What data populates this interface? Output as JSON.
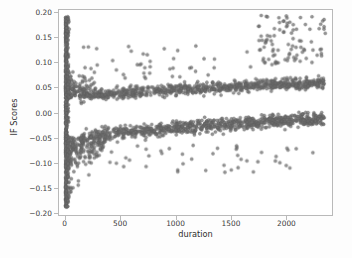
{
  "chart_data": {
    "type": "scatter",
    "title": "",
    "xlabel": "duration",
    "ylabel": "IF Scores",
    "xlim": [
      -60,
      2420
    ],
    "ylim": [
      -0.205,
      0.205
    ],
    "xticks": [
      0,
      500,
      1000,
      1500,
      2000
    ],
    "xticklabels": [
      "0",
      "500",
      "1000",
      "1500",
      "2000"
    ],
    "yticks": [
      0.2,
      0.15,
      0.1,
      0.05,
      0.0,
      -0.05,
      -0.1,
      -0.15,
      -0.2
    ],
    "yticklabels": [
      "0.20",
      "0.15",
      "0.10",
      "0.05",
      "0.00",
      "−0.05",
      "−0.10",
      "−0.15",
      "−0.20"
    ],
    "grid": false,
    "legend": null,
    "marker": {
      "shape": "circle",
      "color": "#6e6e6e",
      "edge_color": "#5a5a5a",
      "size_px": 3.1,
      "alpha": 0.72
    },
    "axes_frame_color": "#b9b9b9",
    "background_color": "#ffffff",
    "figure_background_color": "#fdfdfd",
    "n_points_approx": 2600,
    "clusters": [
      {
        "name": "origin-column",
        "description": "dense near-vertical column of points at duration close to 0 spanning the full IF score range",
        "x_range": [
          0,
          35
        ],
        "y_range": [
          -0.19,
          0.192
        ],
        "n": 540
      },
      {
        "name": "origin-funnel",
        "description": "funnel shaped spread fanning out from the origin column toward duration 350, narrowing toward the two bands",
        "x_range": [
          20,
          360
        ],
        "y_range": [
          -0.165,
          0.125
        ],
        "n": 360
      },
      {
        "name": "upper-band",
        "description": "dense horizontal band drifting upward from about 0.030 to 0.060 as duration increases",
        "x_range": [
          120,
          2350
        ],
        "y_start": 0.03,
        "y_end": 0.06,
        "y_spread": 0.009,
        "n": 760
      },
      {
        "name": "lower-band",
        "description": "dense horizontal band drifting upward from about -0.052 to -0.012 as duration increases",
        "x_range": [
          110,
          2350
        ],
        "y_start": -0.052,
        "y_end": -0.012,
        "y_spread": 0.011,
        "n": 820
      },
      {
        "name": "upper-right-cloud",
        "description": "diffuse cloud of high IF scores at long durations",
        "x_range": [
          1750,
          2360
        ],
        "y_range": [
          0.095,
          0.195
        ],
        "n": 95
      },
      {
        "name": "sparse-upper-outliers",
        "description": "isolated points scattered above the upper band across mid durations",
        "x_range": [
          150,
          1750
        ],
        "y_range": [
          0.065,
          0.135
        ],
        "n": 45
      },
      {
        "name": "sparse-lower-outliers",
        "description": "isolated points scattered below the lower band across mid durations",
        "x_range": [
          300,
          2300
        ],
        "y_range": [
          -0.12,
          -0.062
        ],
        "n": 45
      }
    ]
  }
}
